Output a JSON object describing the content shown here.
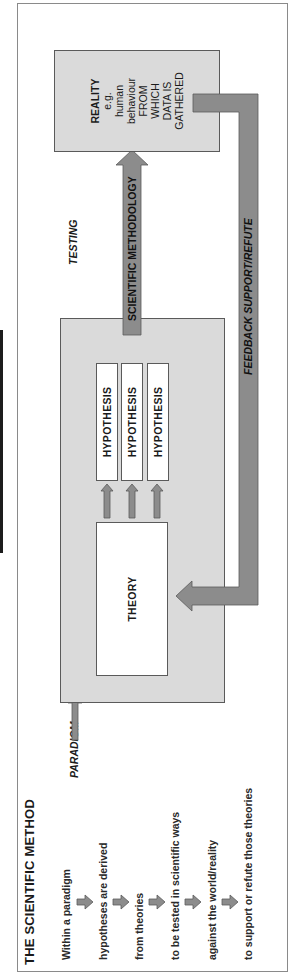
{
  "title": "THE SCIENTIFIC METHOD",
  "steps": [
    "Within a paradigm",
    "hypotheses are derived",
    "from theories",
    "to be tested in scientific ways",
    "against the world/reality",
    "to support or refute those theories"
  ],
  "paradigm": {
    "label": "PARADIGM",
    "theory_label": "THEORY",
    "hypotheses": [
      "HYPOTHESIS",
      "HYPOTHESIS",
      "HYPOTHESIS"
    ]
  },
  "testing_label": "TESTING",
  "methodology_arrow_label": "SCIENTIFIC METHODOLOGY",
  "feedback_arrow_label": "FEEDBACK SUPPORT/REFUTE",
  "reality": {
    "title": "REALITY",
    "lines": [
      "e.g.",
      "human",
      "behaviour",
      "FROM",
      "WHICH",
      "DATA IS",
      "GATHERED"
    ]
  },
  "colors": {
    "arrow_fill": "#8c8c8c",
    "arrow_stroke": "#5a5a5a",
    "box_fill": "#dadada",
    "border": "#5a5a5a",
    "text": "#1a1a1a"
  }
}
